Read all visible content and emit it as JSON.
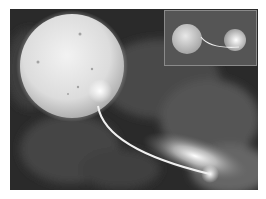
{
  "image": {
    "description": "Grayscale astronomical illustration: large sun-like star with mass stream flowing to a compact companion with accretion disk glow; inset shows the binary pair",
    "colors": {
      "background": "#2a2a2a",
      "cloud": "#4a4a4a",
      "star": "#e6e6e6",
      "glow": "#ffffff",
      "inset_bg": "#555555"
    }
  }
}
